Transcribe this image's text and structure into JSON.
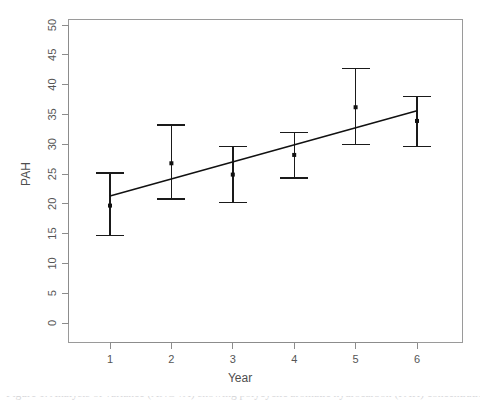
{
  "figure": {
    "caption_fragment": "Figure 1. Analysis of variance (ANOVA) showing polycyclic aromatic hydrocarbon (PAH) concentrations versus time for"
  },
  "chart_data": {
    "type": "scatter",
    "title": "",
    "subtitle": "",
    "xlabel": "Year",
    "ylabel": "PAH",
    "x": [
      1,
      2,
      3,
      4,
      5,
      6
    ],
    "categories": [
      "1",
      "2",
      "3",
      "4",
      "5",
      "6"
    ],
    "values": [
      19.7,
      26.8,
      24.9,
      28.2,
      36.2,
      33.9
    ],
    "error_low": [
      14.7,
      20.8,
      20.2,
      24.3,
      29.9,
      29.6
    ],
    "error_high": [
      25.2,
      33.2,
      29.6,
      32.0,
      42.7,
      38.0
    ],
    "series": [
      {
        "name": "PAH mean",
        "values": [
          19.7,
          26.8,
          24.9,
          28.2,
          36.2,
          33.9
        ]
      },
      {
        "name": "Fitted regression line",
        "x": [
          1,
          6
        ],
        "values": [
          21.3,
          35.6
        ]
      }
    ],
    "xlim": [
      0.55,
      6.45
    ],
    "ylim": [
      -1.5,
      51.5
    ],
    "xticks": [
      1,
      2,
      3,
      4,
      5,
      6
    ],
    "xtick_labels": [
      "1",
      "2",
      "3",
      "4",
      "5",
      "6"
    ],
    "yticks": [
      0,
      5,
      10,
      15,
      20,
      25,
      30,
      35,
      40,
      45,
      50
    ],
    "ytick_labels": [
      "0",
      "5",
      "10",
      "15",
      "20",
      "25",
      "30",
      "35",
      "40",
      "45",
      "50"
    ],
    "grid": false,
    "legend": false,
    "legend_position": "none",
    "marker": "filled-square",
    "annotations": []
  },
  "axes": {
    "y_title": "PAH",
    "x_title": "Year",
    "y_tick_labels": [
      "0",
      "5",
      "10",
      "15",
      "20",
      "25",
      "30",
      "35",
      "40",
      "45",
      "50"
    ],
    "x_tick_labels": [
      "1",
      "2",
      "3",
      "4",
      "5",
      "6"
    ]
  },
  "colors": {
    "background": "#ffffff",
    "axis": "#8c8c8c",
    "panel_border": "#9a9a9a",
    "data": "#111111",
    "tick_text": "#555555",
    "caption": "#b9b9bd"
  }
}
